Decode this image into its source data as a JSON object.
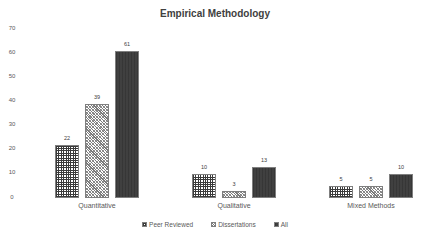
{
  "chart_data": {
    "type": "bar",
    "title": "Empirical Methodology",
    "xlabel": "",
    "ylabel": "",
    "ylim": [
      0,
      70
    ],
    "yticks": [
      "0",
      "10",
      "20",
      "30",
      "40",
      "50",
      "60",
      "70"
    ],
    "grid": false,
    "legend_position": "bottom",
    "categories": [
      "Quantitative",
      "Qualitative",
      "Mixed Methods"
    ],
    "series": [
      {
        "name": "Peer Reviewed",
        "values": [
          22,
          10,
          5
        ],
        "labels": [
          "22",
          "10",
          "5"
        ]
      },
      {
        "name": "Dissertations",
        "values": [
          39,
          3,
          5
        ],
        "labels": [
          "39",
          "3",
          "5"
        ]
      },
      {
        "name": "All",
        "values": [
          61,
          13,
          10
        ],
        "labels": [
          "61",
          "13",
          "10"
        ]
      }
    ]
  }
}
